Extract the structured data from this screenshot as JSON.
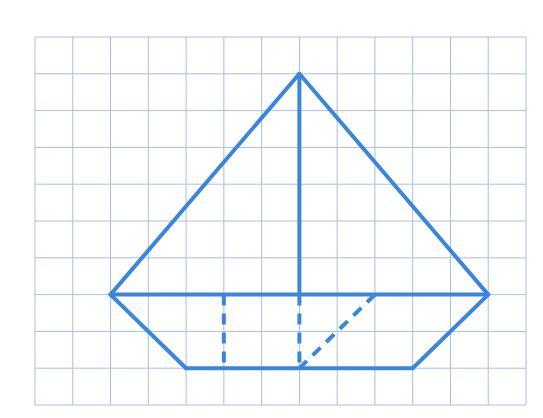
{
  "diagram": {
    "type": "grid-figure",
    "grid": {
      "columns": 13,
      "rows": 10,
      "left": 35,
      "top": 37,
      "right": 526,
      "bottom": 405,
      "line_color": "#a9bedf"
    },
    "stroke_color": "#3b86d8",
    "stroke_width": 4,
    "segments": [
      {
        "name": "sail-left-edge",
        "from": [
          7,
          1
        ],
        "to": [
          2,
          7
        ],
        "style": "solid"
      },
      {
        "name": "sail-right-edge",
        "from": [
          7,
          1
        ],
        "to": [
          12,
          7
        ],
        "style": "solid"
      },
      {
        "name": "mast",
        "from": [
          7,
          1
        ],
        "to": [
          7,
          7
        ],
        "style": "solid"
      },
      {
        "name": "deck-line",
        "from": [
          2,
          7
        ],
        "to": [
          12,
          7
        ],
        "style": "solid"
      },
      {
        "name": "hull-left-edge",
        "from": [
          2,
          7
        ],
        "to": [
          4,
          9
        ],
        "style": "solid"
      },
      {
        "name": "hull-right-edge",
        "from": [
          12,
          7
        ],
        "to": [
          10,
          9
        ],
        "style": "solid"
      },
      {
        "name": "hull-bottom",
        "from": [
          4,
          9
        ],
        "to": [
          10,
          9
        ],
        "style": "solid"
      },
      {
        "name": "hull-dashed-vertical-left",
        "from": [
          5,
          7
        ],
        "to": [
          5,
          9
        ],
        "style": "dashed"
      },
      {
        "name": "hull-dashed-vertical-mast",
        "from": [
          7,
          7
        ],
        "to": [
          7,
          9
        ],
        "style": "dashed"
      },
      {
        "name": "hull-dashed-diagonal",
        "from": [
          9,
          7
        ],
        "to": [
          7,
          9
        ],
        "style": "dashed"
      }
    ]
  }
}
